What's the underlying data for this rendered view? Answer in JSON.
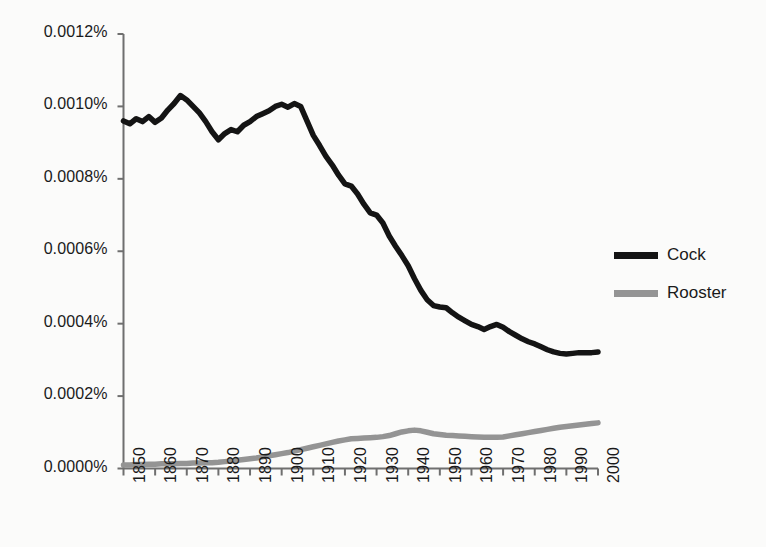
{
  "chart_data": {
    "type": "line",
    "title": "",
    "subtitle": "",
    "xlabel": "",
    "ylabel": "",
    "grid": false,
    "legend_position": "right",
    "xlim": [
      1850,
      2000
    ],
    "ylim": [
      0.0,
      0.0012
    ],
    "y_tick_labels": [
      "0.0012%",
      "0.0010%",
      "0.0008%",
      "0.0006%",
      "0.0004%",
      "0.0002%",
      "0.0000%"
    ],
    "y_tick_values": [
      0.0012,
      0.001,
      0.0008,
      0.0006,
      0.0004,
      0.0002,
      0.0
    ],
    "x_tick_labels": [
      "1850",
      "1860",
      "1870",
      "1880",
      "1890",
      "1900",
      "1910",
      "1920",
      "1930",
      "1940",
      "1950",
      "1960",
      "1970",
      "1980",
      "1990",
      "2000"
    ],
    "x_tick_values": [
      1850,
      1860,
      1870,
      1880,
      1890,
      1900,
      1910,
      1920,
      1930,
      1940,
      1950,
      1960,
      1970,
      1980,
      1990,
      2000
    ],
    "x": [
      1850,
      1852,
      1854,
      1856,
      1858,
      1860,
      1862,
      1864,
      1866,
      1868,
      1870,
      1872,
      1874,
      1876,
      1878,
      1880,
      1882,
      1884,
      1886,
      1888,
      1890,
      1892,
      1894,
      1896,
      1898,
      1900,
      1902,
      1904,
      1906,
      1908,
      1910,
      1912,
      1914,
      1916,
      1918,
      1920,
      1922,
      1924,
      1926,
      1928,
      1930,
      1932,
      1934,
      1936,
      1938,
      1940,
      1942,
      1944,
      1946,
      1948,
      1950,
      1952,
      1954,
      1956,
      1958,
      1960,
      1962,
      1964,
      1966,
      1968,
      1970,
      1972,
      1974,
      1976,
      1978,
      1980,
      1982,
      1984,
      1986,
      1988,
      1990,
      1992,
      1994,
      1996,
      1998,
      2000
    ],
    "series": [
      {
        "name": "Cock",
        "color": "#141414",
        "values": [
          0.00096,
          0.000952,
          0.000966,
          0.000958,
          0.000972,
          0.000956,
          0.000968,
          0.00099,
          0.001008,
          0.00103,
          0.001018,
          0.001,
          0.000982,
          0.000958,
          0.00093,
          0.000908,
          0.000925,
          0.000936,
          0.00093,
          0.000948,
          0.000958,
          0.000972,
          0.00098,
          0.000988,
          0.001,
          0.001006,
          0.000998,
          0.001008,
          0.001,
          0.00096,
          0.00092,
          0.000892,
          0.000862,
          0.000838,
          0.00081,
          0.000786,
          0.00078,
          0.000758,
          0.00073,
          0.000706,
          0.0007,
          0.000678,
          0.000642,
          0.000614,
          0.000588,
          0.00056,
          0.000524,
          0.000492,
          0.000466,
          0.00045,
          0.000446,
          0.000444,
          0.00043,
          0.000418,
          0.000408,
          0.000398,
          0.000392,
          0.000384,
          0.000392,
          0.000398,
          0.00039,
          0.000378,
          0.000368,
          0.000358,
          0.00035,
          0.000344,
          0.000336,
          0.000328,
          0.000322,
          0.000318,
          0.000316,
          0.000318,
          0.00032,
          0.00032,
          0.00032,
          0.000322
        ]
      },
      {
        "name": "Rooster",
        "color": "#949494",
        "values": [
          1e-05,
          1e-05,
          1.1e-05,
          1.1e-05,
          1.2e-05,
          1.2e-05,
          1.3e-05,
          1.3e-05,
          1.3e-05,
          1.4e-05,
          1.4e-05,
          1.5e-05,
          1.5e-05,
          1.6e-05,
          1.6e-05,
          1.7e-05,
          1.9e-05,
          2.1e-05,
          2.3e-05,
          2.5e-05,
          2.7e-05,
          2.9e-05,
          3.2e-05,
          3.5e-05,
          3.8e-05,
          4.1e-05,
          4.4e-05,
          4.8e-05,
          5.2e-05,
          5.6e-05,
          6e-05,
          6.4e-05,
          6.8e-05,
          7.2e-05,
          7.6e-05,
          7.9e-05,
          8.2e-05,
          8.3e-05,
          8.4e-05,
          8.5e-05,
          8.6e-05,
          8.8e-05,
          9.1e-05,
          9.6e-05,
          0.000101,
          0.000104,
          0.000106,
          0.000104,
          0.0001,
          9.6e-05,
          9.4e-05,
          9.2e-05,
          9.1e-05,
          9e-05,
          8.9e-05,
          8.8e-05,
          8.7e-05,
          8.6e-05,
          8.6e-05,
          8.6e-05,
          8.7e-05,
          9e-05,
          9.3e-05,
          9.6e-05,
          9.9e-05,
          0.000102,
          0.000105,
          0.000108,
          0.000111,
          0.000114,
          0.000116,
          0.000118,
          0.00012,
          0.000122,
          0.000124,
          0.000126
        ]
      }
    ]
  },
  "legend": {
    "entries": [
      {
        "label": "Cock",
        "color": "#141414"
      },
      {
        "label": "Rooster",
        "color": "#949494"
      }
    ]
  }
}
